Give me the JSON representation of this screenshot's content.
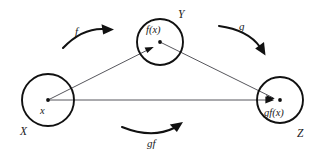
{
  "diagram": {
    "stroke_color": "#111111",
    "line_color": "#43434a",
    "background": "#ffffff",
    "sets": [
      {
        "id": "domain-x",
        "set_label": "X",
        "element_label": "x",
        "cx": 48,
        "cy": 100,
        "r": 26
      },
      {
        "id": "codomain-y",
        "set_label": "Y",
        "element_label": "f(x)",
        "cx": 160,
        "cy": 42,
        "r": 23
      },
      {
        "id": "codomain-z",
        "set_label": "Z",
        "element_label": "gf(x)",
        "cx": 280,
        "cy": 100,
        "r": 23
      }
    ],
    "maps": [
      {
        "id": "map-f",
        "label": "f",
        "from": "X",
        "to": "Y"
      },
      {
        "id": "map-g",
        "label": "g",
        "from": "Y",
        "to": "Z"
      },
      {
        "id": "map-gf",
        "label": "gf",
        "from": "X",
        "to": "Z"
      }
    ]
  }
}
